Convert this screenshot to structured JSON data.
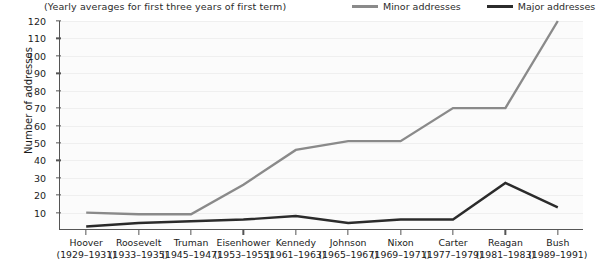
{
  "subtitle": "(Yearly averages for first three years of first term)",
  "legend": {
    "position": "top-right",
    "entries": [
      {
        "label": "Minor addresses",
        "color": "#8a8a8a",
        "swatch_name": "legend-swatch-minor"
      },
      {
        "label": "Major addresses",
        "color": "#2b2b2b",
        "swatch_name": "legend-swatch-major"
      }
    ]
  },
  "chart_data": {
    "type": "line",
    "title": "",
    "subtitle": "(Yearly averages for first three years of first term)",
    "xlabel": "",
    "ylabel": "Number of addresses",
    "ylim": [
      0,
      120
    ],
    "yticks": [
      10,
      20,
      30,
      40,
      50,
      60,
      70,
      80,
      90,
      100,
      110,
      120
    ],
    "grid": true,
    "legend_position": "top-right",
    "categories": [
      "Hoover",
      "Roosevelt",
      "Truman",
      "Eisenhower",
      "Kennedy",
      "Johnson",
      "Nixon",
      "Carter",
      "Reagan",
      "Bush"
    ],
    "category_years": [
      "(1929–1931)",
      "(1933–1935)",
      "(1945–1947)",
      "(1953–1955)",
      "(1961–1963)",
      "(1965–1967)",
      "(1969–1971)",
      "(1977–1979)",
      "(1981–1983)",
      "(1989–1991)"
    ],
    "series": [
      {
        "name": "Minor addresses",
        "color": "#8a8a8a",
        "values": [
          10,
          9,
          9,
          26,
          46,
          51,
          51,
          70,
          70,
          120
        ]
      },
      {
        "name": "Major addresses",
        "color": "#2b2b2b",
        "values": [
          2,
          4,
          5,
          6,
          8,
          4,
          6,
          6,
          27,
          13
        ]
      }
    ]
  }
}
